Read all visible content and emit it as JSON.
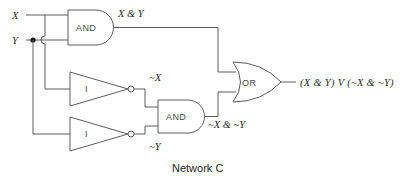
{
  "diagram": {
    "caption": "Network C",
    "inputs": [
      {
        "id": "x",
        "label": "X"
      },
      {
        "id": "y",
        "label": "Y"
      }
    ],
    "gates": [
      {
        "id": "and-top",
        "type": "AND",
        "label": "AND",
        "output_label": "X & Y"
      },
      {
        "id": "inverter-x",
        "type": "NOT",
        "label": "I",
        "output_label": "~X"
      },
      {
        "id": "inverter-y",
        "type": "NOT",
        "label": "I",
        "output_label": "~Y"
      },
      {
        "id": "and-bottom",
        "type": "AND",
        "label": "AND",
        "output_label": "~X & ~Y"
      },
      {
        "id": "or-gate",
        "type": "OR",
        "label": "OR",
        "output_label": "(X & Y) V (~X & ~Y)"
      }
    ],
    "colors": {
      "background": "#ffffff",
      "wire": "#5c5c5c",
      "gate_outline": "#5c5c5c",
      "gate_text": "#4a4a4a",
      "label_text": "#2b2b2b",
      "caption_text": "#1f1f1f",
      "junction": "#1a1a1a"
    }
  }
}
